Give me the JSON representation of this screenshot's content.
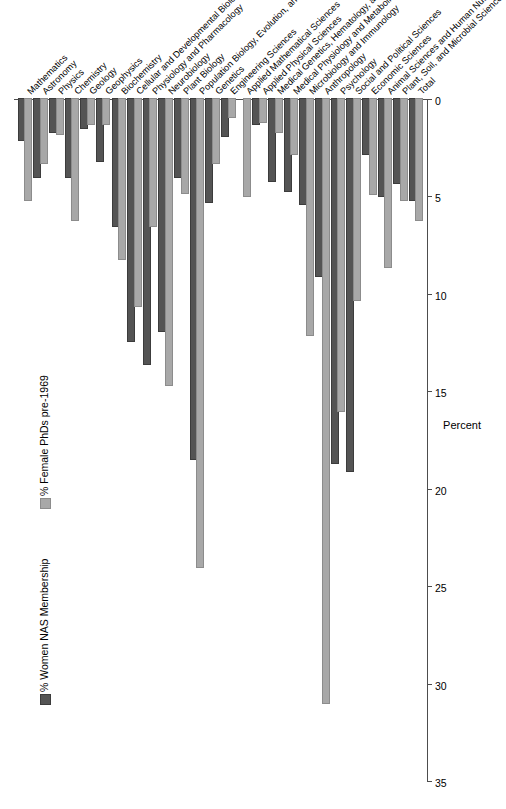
{
  "chart_data": {
    "type": "bar",
    "orientation": "vertical-grouped",
    "title": "",
    "xlabel": "",
    "ylabel": "Percent",
    "ylim": [
      0,
      35
    ],
    "yticks": [
      0,
      5,
      10,
      15,
      20,
      25,
      30,
      35
    ],
    "grid": false,
    "legend_position": "top-left",
    "colors": {
      "phd": "#a8a8a8",
      "nas": "#545454",
      "axis": "#4d4d4d",
      "background": "#ffffff"
    },
    "categories": [
      "Mathematics",
      "Astronomy",
      "Physics",
      "Chemistry",
      "Geology",
      "Geophysics",
      "Biochemistry",
      "Cellular and Developmental Biology",
      "Physiology and Pharmacology",
      "Neurobiology",
      "Plant Biology",
      "Population Biology, Evolution, and Ecology",
      "Genetics",
      "Engineering Sciences",
      "Applied Mathematical Sciences",
      "Applied Physical Sciences",
      "Medical Genetics, Hematology, and Oncology",
      "Medical Physiology and Metabolism",
      "Microbiology and Immunology",
      "Anthropology",
      "Psychology",
      "Social and Political Sciences",
      "Economic Sciences",
      "Animal Sciences and Human Nutrition",
      "Plant, Soil, and Microbial Sciences",
      "Total"
    ],
    "series": [
      {
        "name": "% Female PhDs pre-1969",
        "key": "phd",
        "color": "#a8a8a8",
        "values": [
          5.2,
          3.3,
          1.8,
          6.2,
          1.3,
          1.3,
          8.2,
          10.6,
          6.5,
          14.7,
          4.8,
          24.0,
          3.3,
          0.9,
          5.0,
          1.2,
          1.7,
          2.8,
          12.1,
          31.0,
          16.0,
          10.3,
          4.9,
          8.6,
          5.2,
          6.2
        ]
      },
      {
        "name": "% Women NAS Membership",
        "key": "nas",
        "color": "#545454",
        "values": [
          2.1,
          4.0,
          1.7,
          4.0,
          1.5,
          3.2,
          6.5,
          12.4,
          13.6,
          11.9,
          4.0,
          18.5,
          5.3,
          1.9,
          0.0,
          1.3,
          4.2,
          4.7,
          5.4,
          9.1,
          18.7,
          19.1,
          2.8,
          5.0,
          4.3,
          5.2
        ]
      }
    ],
    "legend": [
      {
        "label": "% Female PhDs pre-1969",
        "key": "phd"
      },
      {
        "label": "% Women NAS Membership",
        "key": "nas"
      }
    ]
  }
}
